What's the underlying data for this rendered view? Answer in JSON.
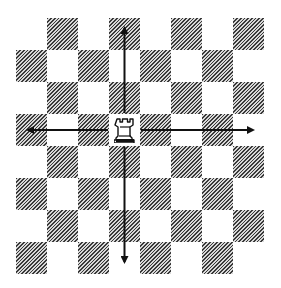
{
  "diagram": {
    "board": {
      "rows": 8,
      "cols": 8,
      "dark_pattern": "hatched",
      "first_square": "light"
    },
    "piece": {
      "type": "rook",
      "color": "white",
      "row": 3,
      "col": 3,
      "glyph": "♖"
    },
    "arrows": [
      {
        "direction": "up",
        "label": "up-arrow"
      },
      {
        "direction": "down",
        "label": "down-arrow"
      },
      {
        "direction": "left",
        "label": "left-arrow"
      },
      {
        "direction": "right",
        "label": "right-arrow"
      }
    ],
    "colors": {
      "arrow": "#111111",
      "dark_square": "#6b6b6b",
      "light_square": "#ffffff"
    }
  }
}
